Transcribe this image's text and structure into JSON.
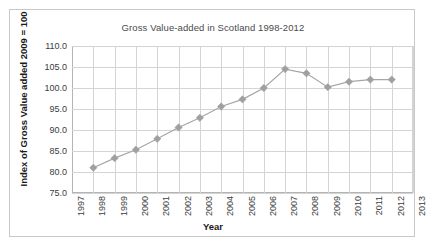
{
  "chart_data": {
    "type": "line",
    "title": "Gross Value-added in Scotland 1998-2012",
    "xlabel": "Year",
    "ylabel": "Index of Gross Value added 2009 = 100",
    "x": [
      1998,
      1999,
      2000,
      2001,
      2002,
      2003,
      2004,
      2005,
      2006,
      2007,
      2008,
      2009,
      2010,
      2011,
      2012
    ],
    "values": [
      81.0,
      83.3,
      85.3,
      87.9,
      90.6,
      92.9,
      95.6,
      97.3,
      100.0,
      104.5,
      103.5,
      100.2,
      101.5,
      102.0,
      102.0
    ],
    "series": [
      {
        "name": "Index of Gross Value added",
        "values": [
          81.0,
          83.3,
          85.3,
          87.9,
          90.6,
          92.9,
          95.6,
          97.3,
          100.0,
          104.5,
          103.5,
          100.2,
          101.5,
          102.0,
          102.0
        ]
      }
    ],
    "xlim": [
      1997,
      2013
    ],
    "ylim": [
      75.0,
      110.0
    ],
    "ytick_labels": [
      "110.0",
      "105.0",
      "100.0",
      "95.0",
      "90.0",
      "85.0",
      "80.0",
      "75.0"
    ],
    "ytick_values": [
      110.0,
      105.0,
      100.0,
      95.0,
      90.0,
      85.0,
      80.0,
      75.0
    ],
    "xtick_labels": [
      "1997",
      "1998",
      "1999",
      "2000",
      "2001",
      "2002",
      "2003",
      "2004",
      "2005",
      "2006",
      "2007",
      "2008",
      "2009",
      "2010",
      "2011",
      "2012",
      "2013"
    ],
    "xtick_values": [
      1997,
      1998,
      1999,
      2000,
      2001,
      2002,
      2003,
      2004,
      2005,
      2006,
      2007,
      2008,
      2009,
      2010,
      2011,
      2012,
      2013
    ],
    "grid": true,
    "legend": false,
    "line_color": "#a6a6a6",
    "marker_color": "#a0a0a0",
    "grid_color": "#d4d4d4",
    "axis_color": "#b4b4b4",
    "background": "#ffffff"
  }
}
